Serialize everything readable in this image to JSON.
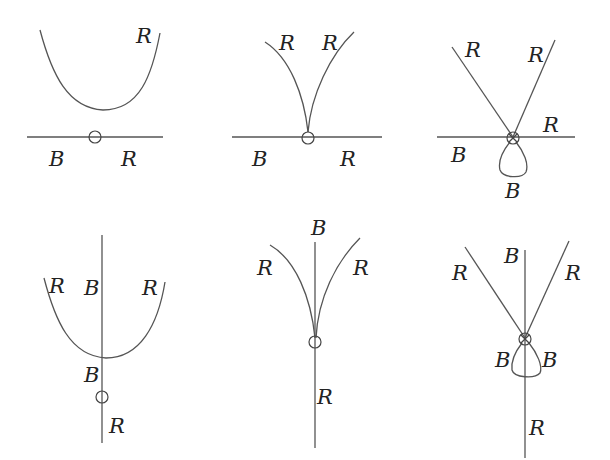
{
  "figure": {
    "type": "bifurcation-diagram",
    "layout": "2x3 grid",
    "panels": [
      {
        "id": "p1",
        "description": "smooth curve above horizontal line, marked point on line",
        "labels": [
          "R",
          "B",
          "R"
        ]
      },
      {
        "id": "p2",
        "description": "cusp touching horizontal line at marked point",
        "labels": [
          "R",
          "R",
          "B",
          "R"
        ]
      },
      {
        "id": "p3",
        "description": "two crossing lines through marked point on horizontal line, loop below",
        "labels": [
          "R",
          "R",
          "R",
          "B",
          "B"
        ]
      },
      {
        "id": "p4",
        "description": "smooth curve crossing vertical line, marked point below on vertical line",
        "labels": [
          "R",
          "B",
          "R",
          "B",
          "R"
        ]
      },
      {
        "id": "p5",
        "description": "cusp on vertical line at marked point",
        "labels": [
          "B",
          "R",
          "R",
          "R"
        ]
      },
      {
        "id": "p6",
        "description": "two crossing lines through marked point on vertical line, loop below",
        "labels": [
          "B",
          "R",
          "R",
          "B",
          "B",
          "R"
        ]
      }
    ]
  },
  "labels": {
    "p1": {
      "a": "R",
      "b": "B",
      "c": "R"
    },
    "p2": {
      "a": "R",
      "b": "R",
      "c": "B",
      "d": "R"
    },
    "p3": {
      "a": "R",
      "b": "R",
      "c": "R",
      "d": "B",
      "e": "B"
    },
    "p4": {
      "a": "R",
      "b": "B",
      "c": "R",
      "d": "B",
      "e": "R"
    },
    "p5": {
      "a": "B",
      "b": "R",
      "c": "R",
      "d": "R"
    },
    "p6": {
      "a": "B",
      "b": "R",
      "c": "R",
      "d": "B",
      "e": "B",
      "f": "R"
    }
  },
  "colors": {
    "stroke": "#555555",
    "text": "#222222",
    "background": "#ffffff"
  }
}
